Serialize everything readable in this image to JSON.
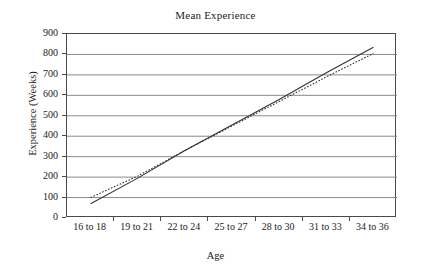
{
  "chart_data": {
    "type": "line",
    "title": "Mean Experience",
    "xlabel": "Age",
    "ylabel": "Experience (Weeks)",
    "categories": [
      "16 to 18",
      "19 to 21",
      "22 to 24",
      "25 to 27",
      "28 to 30",
      "31 to 33",
      "34 to 36"
    ],
    "ylim": [
      0,
      900
    ],
    "yticks": [
      0,
      100,
      200,
      300,
      400,
      500,
      600,
      700,
      800,
      900
    ],
    "ytick_labels": [
      "0",
      "100",
      "200",
      "300",
      "400",
      "500",
      "600",
      "700",
      "800",
      "900"
    ],
    "grid": "horizontal",
    "legend": "none",
    "series": [
      {
        "name": "solid-line",
        "style": "solid",
        "color": "#333333",
        "values": [
          70,
          195,
          330,
          455,
          580,
          710,
          835
        ]
      },
      {
        "name": "dotted-line",
        "style": "dotted",
        "color": "#333333",
        "values": [
          100,
          205,
          330,
          450,
          570,
          690,
          805
        ]
      }
    ],
    "annotations": []
  }
}
